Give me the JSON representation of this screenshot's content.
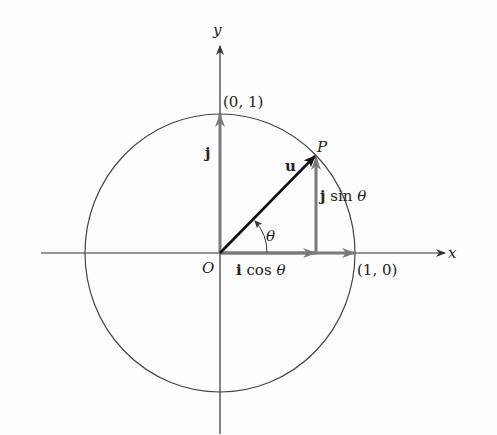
{
  "diagram": {
    "type": "unit-circle-vector-decomposition",
    "axes": {
      "x_label": "x",
      "y_label": "y",
      "origin_label": "O"
    },
    "points": {
      "x_intercept": "(1, 0)",
      "y_intercept": "(0, 1)",
      "point_p": "P"
    },
    "vectors": {
      "u": "u",
      "j": "j",
      "j_sin": {
        "bold": "j",
        "rest": " sin ",
        "theta": "θ"
      },
      "i_cos": {
        "bold": "i",
        "rest": " cos ",
        "theta": "θ"
      }
    },
    "angle_label": "θ",
    "colors": {
      "axis": "#333333",
      "circle": "#444444",
      "vector_u": "#111111",
      "component_vectors": "#7a7a7a"
    }
  }
}
